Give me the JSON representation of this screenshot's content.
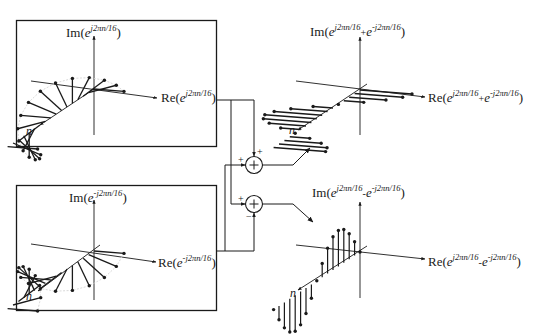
{
  "diagram": {
    "colors": {
      "stroke": "#1a1a1a",
      "guide": "#cfcfcf",
      "background": "#ffffff"
    },
    "panels": {
      "positive_exponential": {
        "im_label": {
          "prefix": "Im(",
          "base": "e",
          "exp": "j2πn/16",
          "suffix": ")"
        },
        "re_label": {
          "prefix": "Re(",
          "base": "e",
          "exp": "j2πn/16",
          "suffix": ")"
        },
        "n_label": "n",
        "rotation": "counter-clockwise"
      },
      "negative_exponential": {
        "im_label": {
          "prefix": "Im(",
          "base": "e",
          "exp": "-j2πn/16",
          "suffix": ")"
        },
        "re_label": {
          "prefix": "Re(",
          "base": "e",
          "exp": "-j2πn/16",
          "suffix": ")"
        },
        "n_label": "n",
        "rotation": "clockwise"
      },
      "sum_output": {
        "im_label": {
          "prefix": "Im(",
          "a": "e",
          "a_exp": "j2πn/16",
          "op": "+",
          "b": "e",
          "b_exp": "-j2πn/16",
          "suffix": ")"
        },
        "re_label": {
          "prefix": "Re(",
          "a": "e",
          "a_exp": "j2πn/16",
          "op": "+",
          "b": "e",
          "b_exp": "-j2πn/16",
          "suffix": ")"
        },
        "n_label": "n",
        "result": "2cos(2πn/16), purely real"
      },
      "difference_output": {
        "im_label": {
          "prefix": "Im(",
          "a": "e",
          "a_exp": "j2πn/16",
          "op": "-",
          "b": "e",
          "b_exp": "-j2πn/16",
          "suffix": ")"
        },
        "re_label": {
          "prefix": "Re(",
          "a": "e",
          "a_exp": "j2πn/16",
          "op": "-",
          "b": "e",
          "b_exp": "-j2πn/16",
          "suffix": ")"
        },
        "n_label": "n",
        "result": "2j·sin(2πn/16), purely imaginary"
      }
    },
    "summers": {
      "top": {
        "symbol": "+",
        "input_left_sign": "+",
        "input_top_sign": "+"
      },
      "bottom": {
        "symbol": "+",
        "input_left_sign": "+",
        "input_bottom_sign": "−"
      }
    },
    "sequence": {
      "period": 16,
      "samples_shown": 17,
      "n_start": 0
    }
  }
}
